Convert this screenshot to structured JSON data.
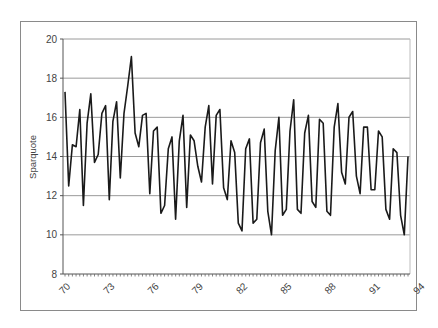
{
  "chart_data": {
    "type": "line",
    "title": "",
    "xlabel": "",
    "ylabel": "Sparquote",
    "ylim": [
      8,
      20
    ],
    "yticks": [
      8,
      10,
      12,
      14,
      16,
      18,
      20
    ],
    "xtick_labels": [
      "70",
      "73",
      "76",
      "79",
      "82",
      "85",
      "88",
      "91",
      "94"
    ],
    "grid": true,
    "legend": "none",
    "frequency": "quarterly, 1970-1994",
    "series": [
      {
        "name": "Sparquote",
        "values": [
          17.3,
          12.5,
          14.6,
          14.5,
          16.4,
          11.5,
          15.7,
          17.2,
          13.7,
          14.1,
          16.2,
          16.6,
          11.8,
          15.8,
          16.8,
          12.9,
          16.2,
          17.6,
          19.1,
          15.2,
          14.5,
          16.1,
          16.2,
          12.1,
          15.3,
          15.5,
          11.1,
          11.5,
          14.4,
          15.0,
          10.8,
          14.8,
          16.1,
          11.4,
          15.1,
          14.8,
          13.5,
          12.7,
          15.5,
          16.6,
          12.6,
          16.1,
          16.4,
          12.4,
          11.8,
          14.8,
          14.2,
          10.6,
          10.2,
          14.4,
          14.9,
          10.6,
          10.8,
          14.7,
          15.4,
          11.2,
          10.0,
          14.3,
          16.0,
          11.0,
          11.3,
          15.3,
          16.9,
          11.3,
          11.1,
          15.2,
          16.1,
          11.7,
          11.4,
          15.9,
          15.7,
          11.2,
          11.0,
          15.5,
          16.7,
          13.2,
          12.6,
          16.0,
          16.3,
          13.0,
          12.1,
          15.5,
          15.5,
          12.3,
          12.3,
          15.3,
          15.0,
          11.3,
          10.8,
          14.4,
          14.2,
          11.0,
          10.0,
          14.0
        ]
      }
    ]
  },
  "axis": {
    "y_labels": [
      "20",
      "18",
      "16",
      "14",
      "12",
      "10",
      "8"
    ],
    "x_labels": [
      "70",
      "73",
      "76",
      "79",
      "82",
      "85",
      "88",
      "91",
      "94"
    ],
    "y_title": "Sparquote"
  }
}
